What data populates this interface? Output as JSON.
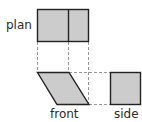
{
  "diagram": {
    "type": "orthographic-projection",
    "header_partial": "",
    "labels": {
      "plan": "plan",
      "front": "front",
      "side": "side"
    },
    "colors": {
      "fill": "#cccccc",
      "stroke": "#222222",
      "dash": "#999999"
    },
    "views": [
      {
        "name": "plan",
        "shape": "rectangle split into two cells",
        "x": 37,
        "y": 9,
        "w": 52,
        "h": 33,
        "divider_x": 68
      },
      {
        "name": "front",
        "shape": "parallelogram",
        "points": [
          [
            37,
            72
          ],
          [
            69,
            72
          ],
          [
            89,
            104
          ],
          [
            57,
            104
          ]
        ]
      },
      {
        "name": "side",
        "shape": "square",
        "x": 110,
        "y": 72,
        "w": 31,
        "h": 32
      }
    ]
  }
}
